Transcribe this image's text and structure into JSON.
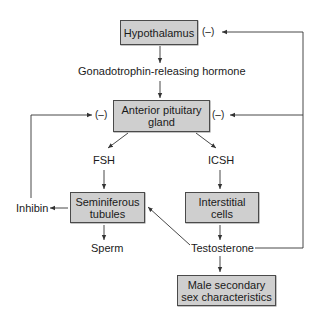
{
  "diagram": {
    "type": "hormonal-feedback-flowchart",
    "colors": {
      "box_fill": "#cfcfcf",
      "box_border": "#4a4a4a",
      "line": "#333333"
    },
    "nodes": {
      "hypothalamus": "Hypothalamus",
      "gnrh": "Gonadotrophin-releasing hormone",
      "anterior_pituitary_line1": "Anterior pituitary",
      "anterior_pituitary_line2": "gland",
      "fsh": "FSH",
      "icsh": "ICSH",
      "seminiferous_line1": "Seminiferous",
      "seminiferous_line2": "tubules",
      "interstitial_line1": "Interstitial",
      "interstitial_line2": "cells",
      "inhibin": "Inhibin",
      "sperm": "Sperm",
      "testosterone": "Testosterone",
      "male_secondary_line1": "Male secondary",
      "male_secondary_line2": "sex characteristics"
    },
    "feedback_marks": {
      "hypothalamus_negative": "(–)",
      "pituitary_left_negative": "(–)",
      "pituitary_right_negative": "(–)"
    },
    "edges": [
      {
        "from": "Hypothalamus",
        "to": "Gonadotrophin-releasing hormone"
      },
      {
        "from": "Gonadotrophin-releasing hormone",
        "to": "Anterior pituitary gland"
      },
      {
        "from": "Anterior pituitary gland",
        "to": "FSH"
      },
      {
        "from": "Anterior pituitary gland",
        "to": "ICSH"
      },
      {
        "from": "FSH",
        "to": "Seminiferous tubules"
      },
      {
        "from": "ICSH",
        "to": "Interstitial cells"
      },
      {
        "from": "Seminiferous tubules",
        "to": "Inhibin"
      },
      {
        "from": "Seminiferous tubules",
        "to": "Sperm"
      },
      {
        "from": "Interstitial cells",
        "to": "Testosterone"
      },
      {
        "from": "Testosterone",
        "to": "Seminiferous tubules"
      },
      {
        "from": "Testosterone",
        "to": "Male secondary sex characteristics"
      },
      {
        "from": "Inhibin",
        "to": "Anterior pituitary gland",
        "type": "negative feedback"
      },
      {
        "from": "Testosterone",
        "to": "Anterior pituitary gland",
        "type": "negative feedback"
      },
      {
        "from": "Testosterone",
        "to": "Hypothalamus",
        "type": "negative feedback"
      }
    ]
  }
}
